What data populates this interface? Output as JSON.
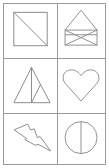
{
  "grid": {
    "rows": 3,
    "columns": 2,
    "border_color": "#9a9a9a",
    "stroke_color": "#8a8a8a"
  },
  "cells": [
    {
      "shape": "square-with-diagonal"
    },
    {
      "shape": "house-envelope"
    },
    {
      "shape": "split-triangle"
    },
    {
      "shape": "heart"
    },
    {
      "shape": "lightning-bolt"
    },
    {
      "shape": "circle-with-vertical-line"
    }
  ]
}
